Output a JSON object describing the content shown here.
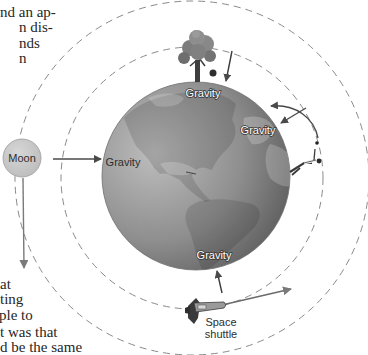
{
  "body_text": {
    "top_fragments": [
      "nd an ap-",
      "n dis-",
      "nds",
      "n"
    ],
    "bottom_fragments": [
      "at",
      "ting",
      "ple to",
      "t was that",
      "d be the same"
    ]
  },
  "figure": {
    "labels": {
      "moon": "Moon",
      "gravity_top": "Gravity",
      "gravity_right": "Gravity",
      "gravity_left": "Gravity",
      "gravity_bottom": "Gravity",
      "shuttle_line1": "Space",
      "shuttle_line2": "shuttle"
    },
    "objects": [
      "Earth",
      "Moon",
      "Apple tree",
      "Apple",
      "Person",
      "Ball",
      "Space shuttle"
    ],
    "orbits": [
      "inner dashed orbit",
      "outer dashed orbit"
    ],
    "colors": {
      "arrow": "#4a4a4a",
      "orbit_dash": "#8a8a8a",
      "moon_fill": "#c9c9c9",
      "earth_light": "#b8b8b8",
      "earth_dark": "#5e5e5e"
    }
  }
}
